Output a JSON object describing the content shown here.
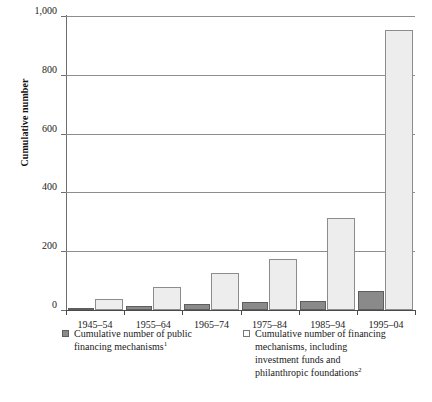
{
  "chart_data": {
    "type": "bar",
    "title": "",
    "subtitle": "",
    "xlabel": "",
    "ylabel": "Cumulative number",
    "ylim": [
      0,
      1000
    ],
    "yticks": [
      0,
      200,
      400,
      600,
      800,
      1000
    ],
    "ytick_labels": [
      "0",
      "200",
      "400",
      "600",
      "800",
      "1,000"
    ],
    "grid": "horizontal",
    "legend_position": "below-axis",
    "categories": [
      "1945–54",
      "1955–64",
      "1965–74",
      "1975–84",
      "1985–94",
      "1995–04"
    ],
    "series": [
      {
        "name": "Cumulative number of public financing mechanisms",
        "footnote": "1",
        "color": "#8a8a8a",
        "values": [
          8,
          12,
          20,
          26,
          32,
          64
        ]
      },
      {
        "name": "Cumulative number of financing mechanisms, including investment funds and philanthropic foundations",
        "footnote": "2",
        "color": "#ededed",
        "values": [
          38,
          78,
          125,
          173,
          313,
          954
        ]
      }
    ]
  },
  "axis": {
    "y_title": "Cumulative number"
  },
  "legend": {
    "items": [
      {
        "swatch": "dark",
        "line1": "Cumulative number of public",
        "line2": "financing mechanisms",
        "footnote": "1"
      },
      {
        "swatch": "light",
        "line1": "Cumulative number of financing",
        "line2": "mechanisms, including",
        "line3": "investment funds and",
        "line4": "philanthropic foundations",
        "footnote": "2"
      }
    ]
  },
  "colors": {
    "series_dark": "#8a8a8a",
    "series_light": "#ededed",
    "gridline": "#8d8d8d",
    "axis": "#4a4a4a",
    "text": "#1a1a1a",
    "background": "#ffffff"
  }
}
